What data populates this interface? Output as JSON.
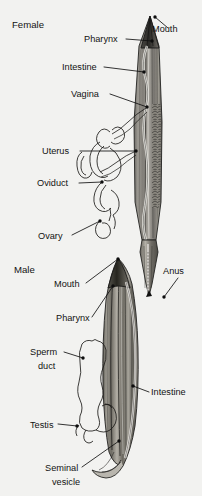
{
  "figure": {
    "title_female": "Female",
    "title_male": "Male",
    "background_color": "#f2f2f0",
    "ink_color": "#121212",
    "body_fill_light": "#cfcdc8",
    "body_fill_mid": "#8e8b85",
    "body_fill_dark": "#3e3c39"
  },
  "female": {
    "section_label": "Female",
    "labels": [
      {
        "id": "mouth",
        "text": "Mouth",
        "x": 152,
        "y": 32,
        "anchor": "start",
        "line": [
          [
            168,
            28
          ],
          [
            155,
            17
          ]
        ],
        "dot": [
          155,
          17
        ]
      },
      {
        "id": "pharynx",
        "text": "Pharynx",
        "x": 84,
        "y": 42,
        "anchor": "start",
        "line": [
          [
            126,
            39
          ],
          [
            152,
            41
          ]
        ],
        "dot": [
          152,
          41
        ]
      },
      {
        "id": "intestine",
        "text": "Intestine",
        "x": 62,
        "y": 70,
        "anchor": "start",
        "line": [
          [
            104,
            67
          ],
          [
            144,
            72
          ]
        ],
        "dot": [
          144,
          72
        ]
      },
      {
        "id": "vagina",
        "text": "Vagina",
        "x": 71,
        "y": 97,
        "anchor": "start",
        "line": [
          [
            110,
            94
          ],
          [
            147,
            107
          ]
        ],
        "dot": [
          147,
          107
        ]
      },
      {
        "id": "uterus",
        "text": "Uterus",
        "x": 42,
        "y": 154,
        "anchor": "start",
        "line": [
          [
            80,
            151
          ],
          [
            136,
            151
          ]
        ],
        "dot": [
          136,
          151
        ]
      },
      {
        "id": "oviduct",
        "text": "Oviduct",
        "x": 37,
        "y": 186,
        "anchor": "start",
        "line": [
          [
            79,
            183
          ],
          [
            102,
            182
          ]
        ],
        "dot": [
          102,
          182
        ]
      },
      {
        "id": "ovary",
        "text": "Ovary",
        "x": 38,
        "y": 239,
        "anchor": "start",
        "line": [
          [
            72,
            235
          ],
          [
            100,
            221
          ]
        ],
        "dot": [
          100,
          221
        ]
      }
    ]
  },
  "male": {
    "section_label": "Male",
    "labels": [
      {
        "id": "anus",
        "text": "Anus",
        "x": 163,
        "y": 274,
        "anchor": "start",
        "line": [
          [
            178,
            278
          ],
          [
            164,
            297
          ]
        ],
        "dot": [
          164,
          297
        ]
      },
      {
        "id": "mouth",
        "text": "Mouth",
        "x": 54,
        "y": 287,
        "anchor": "start",
        "line": [
          [
            86,
            283
          ],
          [
            118,
            259
          ]
        ],
        "dot": [
          118,
          259
        ]
      },
      {
        "id": "pharynx",
        "text": "Pharynx",
        "x": 56,
        "y": 321,
        "anchor": "start",
        "line": [
          [
            92,
            317
          ],
          [
            113,
            286
          ]
        ],
        "dot": [
          113,
          286
        ]
      },
      {
        "id": "sperm_duct_l1",
        "text": "Sperm",
        "x": 30,
        "y": 355,
        "anchor": "start",
        "line": [
          [
            64,
            352
          ],
          [
            83,
            358
          ]
        ],
        "dot": [
          83,
          358
        ]
      },
      {
        "id": "sperm_duct_l2",
        "text": "duct",
        "x": 38,
        "y": 369,
        "anchor": "start",
        "line": null,
        "dot": null
      },
      {
        "id": "intestine",
        "text": "Intestine",
        "x": 151,
        "y": 395,
        "anchor": "start",
        "line": [
          [
            149,
            392
          ],
          [
            133,
            386
          ]
        ],
        "dot": [
          133,
          386
        ]
      },
      {
        "id": "testis",
        "text": "Testis",
        "x": 30,
        "y": 428,
        "anchor": "start",
        "line": [
          [
            58,
            424
          ],
          [
            77,
            426
          ]
        ],
        "dot": [
          77,
          426
        ]
      },
      {
        "id": "seminal_l1",
        "text": "Seminal",
        "x": 45,
        "y": 471,
        "anchor": "start",
        "line": [
          [
            82,
            467
          ],
          [
            119,
            441
          ]
        ],
        "dot": [
          119,
          441
        ]
      },
      {
        "id": "seminal_l2",
        "text": "vesicle",
        "x": 52,
        "y": 485,
        "anchor": "start",
        "line": null,
        "dot": null
      }
    ]
  },
  "structures": {
    "female_body": "longitudinal tapered worm body, head pointed at mouth",
    "female_gonad": "coiled uterus, oviduct and ovary tubes drawn at left",
    "male_body": "longitudinal striated worm body with hooked tail",
    "male_gonad": "lobed sperm duct with testis tube",
    "female_tail_inset": "detached posterior end showing anus"
  }
}
